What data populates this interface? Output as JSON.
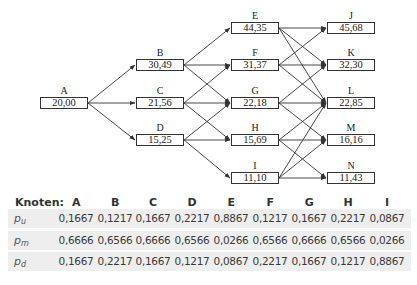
{
  "tree": {
    "nodes": [
      {
        "id": "A",
        "value": "20,00",
        "x": 40,
        "y": 97
      },
      {
        "id": "B",
        "value": "30,49",
        "x": 136,
        "y": 59
      },
      {
        "id": "C",
        "value": "21,56",
        "x": 136,
        "y": 97
      },
      {
        "id": "D",
        "value": "15,25",
        "x": 136,
        "y": 134
      },
      {
        "id": "E",
        "value": "44,35",
        "x": 231,
        "y": 22
      },
      {
        "id": "F",
        "value": "31,37",
        "x": 231,
        "y": 59
      },
      {
        "id": "G",
        "value": "22,18",
        "x": 231,
        "y": 97
      },
      {
        "id": "H",
        "value": "15,69",
        "x": 231,
        "y": 134
      },
      {
        "id": "I",
        "value": "11,10",
        "x": 231,
        "y": 172
      },
      {
        "id": "J",
        "value": "45,68",
        "x": 327,
        "y": 22
      },
      {
        "id": "K",
        "value": "32,30",
        "x": 327,
        "y": 59
      },
      {
        "id": "L",
        "value": "22,85",
        "x": 327,
        "y": 97
      },
      {
        "id": "M",
        "value": "16,16",
        "x": 327,
        "y": 134
      },
      {
        "id": "N",
        "value": "11,43",
        "x": 327,
        "y": 172
      }
    ],
    "edges": [
      [
        "A",
        "B"
      ],
      [
        "A",
        "C"
      ],
      [
        "A",
        "D"
      ],
      [
        "B",
        "E"
      ],
      [
        "B",
        "F"
      ],
      [
        "B",
        "G"
      ],
      [
        "C",
        "F"
      ],
      [
        "C",
        "G"
      ],
      [
        "C",
        "H"
      ],
      [
        "D",
        "G"
      ],
      [
        "D",
        "H"
      ],
      [
        "D",
        "I"
      ],
      [
        "E",
        "J"
      ],
      [
        "E",
        "K"
      ],
      [
        "E",
        "L"
      ],
      [
        "F",
        "J"
      ],
      [
        "F",
        "K"
      ],
      [
        "F",
        "L"
      ],
      [
        "G",
        "K"
      ],
      [
        "G",
        "L"
      ],
      [
        "G",
        "M"
      ],
      [
        "H",
        "L"
      ],
      [
        "H",
        "M"
      ],
      [
        "H",
        "N"
      ],
      [
        "I",
        "L"
      ],
      [
        "I",
        "M"
      ],
      [
        "I",
        "N"
      ]
    ]
  },
  "table": {
    "header_label": "Knoten:",
    "columns": [
      "A",
      "B",
      "C",
      "D",
      "E",
      "F",
      "G",
      "H",
      "I"
    ],
    "rows": [
      {
        "label": "p",
        "sub": "u",
        "values": [
          "0,1667",
          "0,1217",
          "0,1667",
          "0,2217",
          "0,8867",
          "0,1217",
          "0,1667",
          "0,2217",
          "0,0867"
        ]
      },
      {
        "label": "p",
        "sub": "m",
        "values": [
          "0,6666",
          "0,6566",
          "0,6666",
          "0,6566",
          "0,0266",
          "0,6566",
          "0,6666",
          "0,6566",
          "0,0266"
        ]
      },
      {
        "label": "p",
        "sub": "d",
        "values": [
          "0,1667",
          "0,2217",
          "0,1667",
          "0,1217",
          "0,0867",
          "0,2217",
          "0,1667",
          "0,1217",
          "0,8867"
        ]
      }
    ]
  },
  "colors": {
    "line": "#333333",
    "row_shade": "#eeeeee",
    "text": "#3a3a3a"
  }
}
